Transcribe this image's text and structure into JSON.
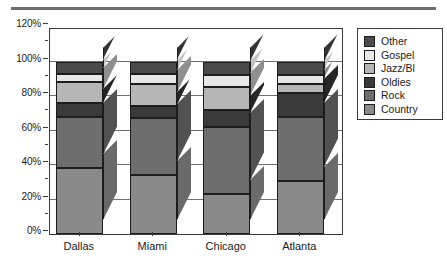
{
  "chart_data": {
    "type": "bar",
    "subtype": "stacked-percent-3d",
    "title": "",
    "xlabel": "",
    "ylabel": "",
    "categories": [
      "Dallas",
      "Miami",
      "Chicago",
      "Atlanta"
    ],
    "ylim": [
      0,
      120
    ],
    "ytick_labels": [
      "0%",
      "20%",
      "40%",
      "60%",
      "80%",
      "100%",
      "120%"
    ],
    "ytick_values": [
      0,
      20,
      40,
      60,
      80,
      100,
      120
    ],
    "yminor_values": [
      10,
      30,
      50,
      70,
      90,
      110
    ],
    "grid": true,
    "legend_position": "right",
    "stack_order_bottom_to_top": [
      "Country",
      "Rock",
      "Oldies",
      "Jazz/Bl",
      "Gospel",
      "Other"
    ],
    "series": [
      {
        "name": "Country",
        "color": "#8a8a8a",
        "side_color": "#6a6a6a",
        "values": [
          38,
          34,
          23,
          31
        ]
      },
      {
        "name": "Rock",
        "color": "#6e6e6e",
        "side_color": "#525252",
        "values": [
          30,
          33,
          39,
          37
        ]
      },
      {
        "name": "Oldies",
        "color": "#3a3a3a",
        "side_color": "#262626",
        "values": [
          8,
          7,
          10,
          14
        ]
      },
      {
        "name": "Jazz/Bl",
        "color": "#b6b6b6",
        "side_color": "#8f8f8f",
        "values": [
          12,
          13,
          13,
          5
        ]
      },
      {
        "name": "Gospel",
        "color": "#e8e8e8",
        "side_color": "#c2c2c2",
        "values": [
          5,
          6,
          7,
          5
        ]
      },
      {
        "name": "Other",
        "color": "#4a4a4a",
        "side_color": "#333333",
        "values": [
          7,
          7,
          8,
          8
        ]
      }
    ],
    "cumulative_tops": {
      "Dallas": {
        "Country": 38,
        "Rock": 68,
        "Oldies": 76,
        "Jazz/Bl": 88,
        "Gospel": 93,
        "Other": 100
      },
      "Miami": {
        "Country": 34,
        "Rock": 67,
        "Oldies": 74,
        "Jazz/Bl": 87,
        "Gospel": 93,
        "Other": 100
      },
      "Chicago": {
        "Country": 23,
        "Rock": 62,
        "Oldies": 72,
        "Jazz/Bl": 85,
        "Gospel": 92,
        "Other": 100
      },
      "Atlanta": {
        "Country": 31,
        "Rock": 68,
        "Oldies": 82,
        "Jazz/Bl": 87,
        "Gospel": 92,
        "Other": 100
      }
    }
  },
  "legend": {
    "items": [
      {
        "label": "Other",
        "color": "#4a4a4a"
      },
      {
        "label": "Gospel",
        "color": "#e8e8e8"
      },
      {
        "label": "Jazz/Bl",
        "color": "#b6b6b6"
      },
      {
        "label": "Oldies",
        "color": "#3a3a3a"
      },
      {
        "label": "Rock",
        "color": "#6e6e6e"
      },
      {
        "label": "Country",
        "color": "#8a8a8a"
      }
    ]
  },
  "axes": {
    "y_labels": [
      "120%",
      "100%",
      "80%",
      "60%",
      "40%",
      "20%",
      "0%"
    ],
    "x_labels": [
      "Dallas",
      "Miami",
      "Chicago",
      "Atlanta"
    ]
  },
  "style": {
    "frame_color": "#3a3a3a",
    "grid_color": "#6f6f6f",
    "rule_color": "#6b6b6b",
    "text_color": "#1b1b1b"
  }
}
